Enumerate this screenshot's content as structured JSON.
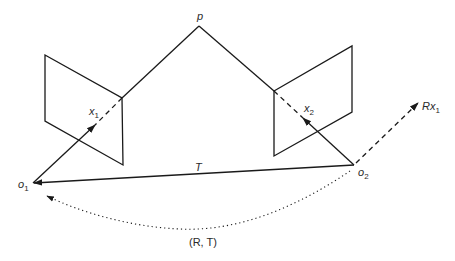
{
  "diagram": {
    "labels": {
      "point": "p",
      "image_point_1": "x",
      "image_point_1_sub": "1",
      "image_point_2": "x",
      "image_point_2_sub": "2",
      "center_1": "o",
      "center_1_sub": "1",
      "center_2": "o",
      "center_2_sub": "2",
      "translation": "T",
      "rotated_ray": "Rx",
      "rotated_ray_sub": "1",
      "transform": "(R, T)"
    },
    "colors": {
      "stroke": "#1a1a1a",
      "text": "#2a2a2a",
      "background": "#ffffff"
    }
  }
}
